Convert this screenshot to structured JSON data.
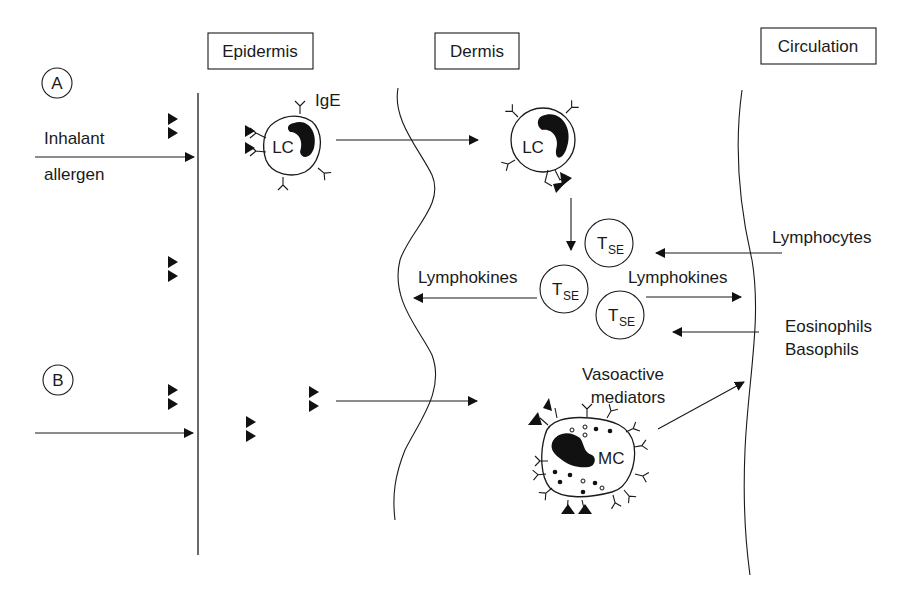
{
  "diagram": {
    "type": "immunology-pathway",
    "regions": {
      "epidermis": "Epidermis",
      "dermis": "Dermis",
      "circulation": "Circulation"
    },
    "pathways": {
      "a": {
        "marker": "A",
        "input_line1": "Inhalant",
        "input_line2": "allergen"
      },
      "b": {
        "marker": "B"
      }
    },
    "cells": {
      "lc_epidermis": {
        "label": "LC",
        "antibody_label": "IgE"
      },
      "lc_dermis": {
        "label": "LC"
      },
      "t_cell_1": {
        "main": "T",
        "sub": "SE"
      },
      "t_cell_2": {
        "main": "T",
        "sub": "SE"
      },
      "t_cell_3": {
        "main": "T",
        "sub": "SE"
      },
      "mast_cell": {
        "label": "MC"
      }
    },
    "flows": {
      "lymphokines_left": "Lymphokines",
      "lymphokines_right": "Lymphokines",
      "lymphocytes_in": "Lymphocytes",
      "eosinophils_in": "Eosinophils",
      "basophils_in": "Basophils",
      "vasoactive_line1": "Vasoactive",
      "vasoactive_line2": "mediators"
    },
    "colors": {
      "ink": "#1a1a1a",
      "background": "#ffffff"
    }
  }
}
